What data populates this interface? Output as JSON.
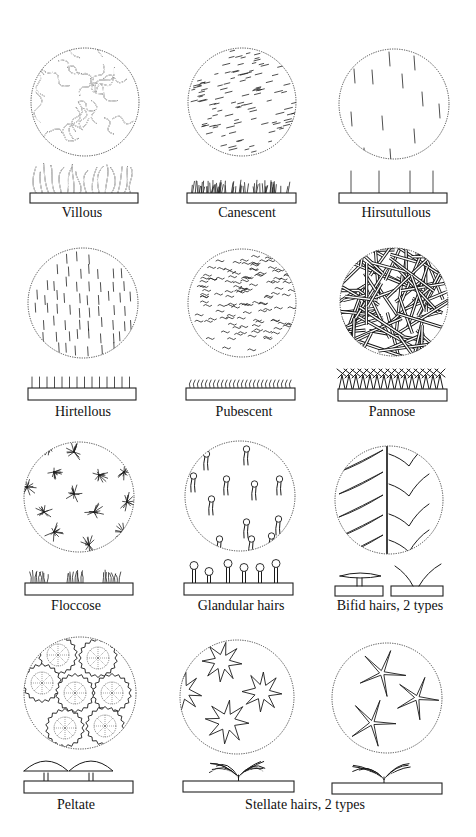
{
  "figure": {
    "ink_color": "#1a1a1a",
    "background": "#ffffff"
  },
  "panels": [
    {
      "id": "villous",
      "label": "Villous",
      "pattern": "wavy-long",
      "circle": {
        "cx": 85,
        "cy": 102,
        "r": 54
      },
      "base": {
        "x": 30,
        "y": 193,
        "w": 108,
        "h": 10
      },
      "label_pos": {
        "x": 82,
        "y": 206
      }
    },
    {
      "id": "canescent",
      "label": "Canescent",
      "pattern": "short-dashes",
      "circle": {
        "cx": 242,
        "cy": 102,
        "r": 54
      },
      "base": {
        "x": 187,
        "y": 193,
        "w": 109,
        "h": 10
      },
      "label_pos": {
        "x": 247,
        "y": 206
      }
    },
    {
      "id": "hirsutullous",
      "label": "Hirsutullous",
      "pattern": "sparse-erect",
      "circle": {
        "cx": 394,
        "cy": 104,
        "r": 55
      },
      "base": {
        "x": 339,
        "y": 193,
        "w": 108,
        "h": 10
      },
      "label_pos": {
        "x": 396,
        "y": 206
      }
    },
    {
      "id": "hirtellous",
      "label": "Hirtellous",
      "pattern": "dense-erect",
      "circle": {
        "cx": 83,
        "cy": 303,
        "r": 55
      },
      "base": {
        "x": 28,
        "y": 388,
        "w": 108,
        "h": 12
      },
      "label_pos": {
        "x": 83,
        "y": 405
      }
    },
    {
      "id": "pubescent",
      "label": "Pubescent",
      "pattern": "soft-wavy",
      "circle": {
        "cx": 242,
        "cy": 303,
        "r": 54
      },
      "base": {
        "x": 186,
        "y": 388,
        "w": 109,
        "h": 12
      },
      "label_pos": {
        "x": 244,
        "y": 405
      }
    },
    {
      "id": "pannose",
      "label": "Pannose",
      "pattern": "felted-stellate",
      "circle": {
        "cx": 394,
        "cy": 302,
        "r": 54
      },
      "base": {
        "x": 338,
        "y": 389,
        "w": 109,
        "h": 12
      },
      "label_pos": {
        "x": 392,
        "y": 405
      }
    },
    {
      "id": "floccose",
      "label": "Floccose",
      "pattern": "tufts",
      "circle": {
        "cx": 79,
        "cy": 497,
        "r": 55
      },
      "base": {
        "x": 25,
        "y": 583,
        "w": 108,
        "h": 12
      },
      "label_pos": {
        "x": 76,
        "y": 599
      }
    },
    {
      "id": "glandular",
      "label": "Glandular hairs",
      "pattern": "glandular",
      "circle": {
        "cx": 240,
        "cy": 496,
        "r": 55
      },
      "base": {
        "x": 184,
        "y": 583,
        "w": 109,
        "h": 12
      },
      "label_pos": {
        "x": 241,
        "y": 599
      }
    },
    {
      "id": "bifid",
      "label": "Bifid hairs, 2 types",
      "pattern": "bifid",
      "circle": {
        "cx": 389,
        "cy": 500,
        "r": 54
      },
      "base": {
        "x": 335,
        "y": 586,
        "w": 108,
        "h": 10
      },
      "label_pos": {
        "x": 390,
        "y": 599
      }
    },
    {
      "id": "peltate",
      "label": "Peltate",
      "pattern": "peltate",
      "circle": {
        "cx": 80,
        "cy": 693,
        "r": 56
      },
      "base": {
        "x": 24,
        "y": 781,
        "w": 109,
        "h": 12
      },
      "label_pos": {
        "x": 76,
        "y": 798
      }
    },
    {
      "id": "stellate-1",
      "label": "",
      "pattern": "stellate-broad",
      "circle": {
        "cx": 237,
        "cy": 697,
        "r": 57
      },
      "base": {
        "x": 183,
        "y": 781,
        "w": 111,
        "h": 11
      },
      "label_pos": null
    },
    {
      "id": "stellate-2",
      "label": "",
      "pattern": "stellate-thin",
      "circle": {
        "cx": 387,
        "cy": 698,
        "r": 55
      },
      "base": {
        "x": 332,
        "y": 783,
        "w": 110,
        "h": 11
      },
      "label_pos": null
    }
  ],
  "shared_labels": [
    {
      "id": "stellate-label",
      "label": "Stellate hairs, 2 types",
      "x": 305,
      "y": 798
    }
  ]
}
